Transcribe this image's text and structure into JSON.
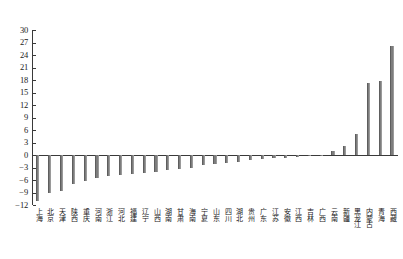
{
  "chart_data": {
    "type": "bar",
    "title": "",
    "subtitle": "",
    "xlabel": "",
    "ylabel": "",
    "ylim": [
      -12,
      30
    ],
    "ytick_step": 3,
    "yticks": [
      -12,
      -9,
      -6,
      -3,
      0,
      3,
      6,
      9,
      12,
      15,
      18,
      21,
      24,
      27,
      30
    ],
    "ytick_labels": [
      "−12",
      "−9",
      "−6",
      "−3",
      "0",
      "3",
      "6",
      "9",
      "12",
      "15",
      "18",
      "21",
      "24",
      "27",
      "30"
    ],
    "grid": false,
    "legend": null,
    "bar_color": "#7d7d7d",
    "axis_color": "#3a3a3a",
    "categories": [
      "上海",
      "北京",
      "天津",
      "陕西",
      "重庆",
      "河南",
      "浙江",
      "河北",
      "福建",
      "辽宁",
      "山西",
      "湖南",
      "甘肃",
      "海南",
      "宁夏",
      "山东",
      "四川",
      "湖北",
      "贵州",
      "广东",
      "江苏",
      "安徽",
      "江西",
      "吉林",
      "广西",
      "云南",
      "新疆",
      "黑龙江",
      "内蒙古",
      "青海",
      "西藏"
    ],
    "values": [
      -11.0,
      -9.2,
      -8.6,
      -7.0,
      -6.3,
      -5.4,
      -5.1,
      -4.9,
      -4.6,
      -4.3,
      -4.0,
      -3.7,
      -3.3,
      -3.0,
      -2.5,
      -2.2,
      -1.9,
      -1.6,
      -1.3,
      -1.0,
      -0.8,
      -0.6,
      -0.4,
      -0.2,
      0.0,
      0.9,
      2.1,
      5.0,
      17.2,
      17.8,
      26.2
    ]
  }
}
